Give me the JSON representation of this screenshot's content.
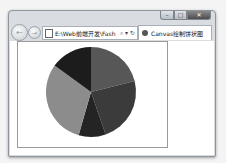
{
  "window": {
    "caption_buttons": {
      "minimize": "–",
      "maximize": "□",
      "close": "✕"
    }
  },
  "navbar": {
    "back_icon": "←",
    "forward_icon": "→",
    "address": "E:\\Web前端开发\\Fash",
    "search_icon": "⌕",
    "dropdown_icon": "▾",
    "refresh_icon": "↻"
  },
  "tab": {
    "title": "Canvas绘制饼状图"
  },
  "chart_data": {
    "type": "pie",
    "title": "",
    "center": [
      91,
      92
    ],
    "radius": 45,
    "slices": [
      {
        "start_deg": 0,
        "end_deg": 76,
        "color": "#575757"
      },
      {
        "start_deg": 76,
        "end_deg": 161,
        "color": "#3b3b3b"
      },
      {
        "start_deg": 161,
        "end_deg": 196,
        "color": "#242424"
      },
      {
        "start_deg": 196,
        "end_deg": 306,
        "color": "#8c8c8c"
      },
      {
        "start_deg": 306,
        "end_deg": 360,
        "color": "#1c1c1c"
      }
    ]
  }
}
